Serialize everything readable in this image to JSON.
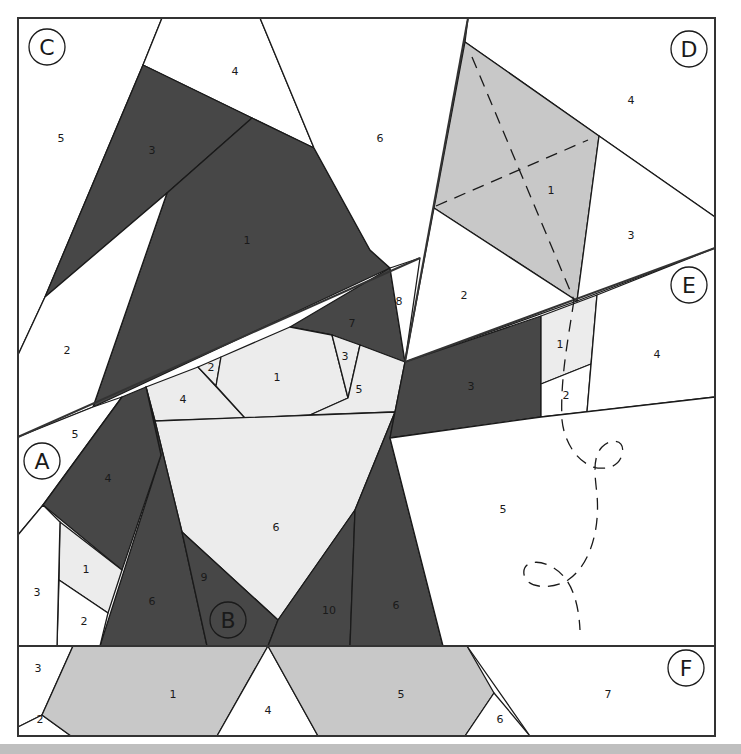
{
  "colors": {
    "dark": "#474747",
    "medium": "#c8c8c8",
    "light": "#ececec",
    "white": "#ffffff",
    "line": "#1a1a1a"
  },
  "sections": {
    "A": "A",
    "B": "B",
    "C": "C",
    "D": "D",
    "E": "E",
    "F": "F"
  },
  "pieces": {
    "C": {
      "p1": "1",
      "p2": "2",
      "p3": "3",
      "p4": "4",
      "p5": "5",
      "p6": "6",
      "p7": "7",
      "p8": "8"
    },
    "B": {
      "p1": "1",
      "p2": "2",
      "p3": "3",
      "p4": "4",
      "p5": "5",
      "p6": "6",
      "p6b": "6",
      "p9": "9",
      "p10": "10"
    },
    "A": {
      "p1": "1",
      "p2": "2",
      "p3": "3",
      "p4": "4",
      "p5": "5",
      "p6": "6"
    },
    "D": {
      "p1": "1",
      "p2": "2",
      "p3": "3",
      "p4": "4"
    },
    "E": {
      "p1": "1",
      "p2": "2",
      "p3": "3",
      "p4": "4",
      "p5": "5"
    },
    "F": {
      "p1": "1",
      "p2": "2",
      "p3": "3",
      "p4": "4",
      "p5": "5",
      "p6": "6",
      "p7": "7"
    }
  }
}
